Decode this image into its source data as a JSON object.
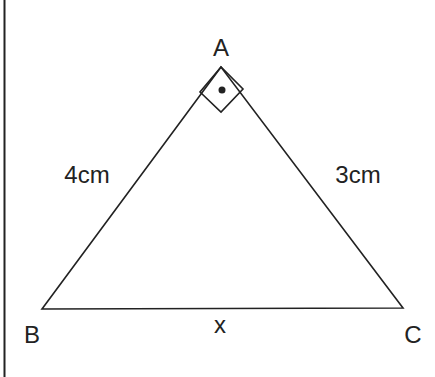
{
  "figure": {
    "type": "right-triangle",
    "vertices": {
      "A": {
        "label": "A",
        "x": 221,
        "y": 67
      },
      "B": {
        "label": "B",
        "x": 42,
        "y": 309
      },
      "C": {
        "label": "C",
        "x": 403,
        "y": 308
      }
    },
    "sides": {
      "AB": {
        "label": "4cm"
      },
      "AC": {
        "label": "3cm"
      },
      "BC": {
        "label": "x"
      }
    },
    "right_angle_at": "A",
    "colors": {
      "stroke": "#222222",
      "background": "#ffffff"
    }
  }
}
